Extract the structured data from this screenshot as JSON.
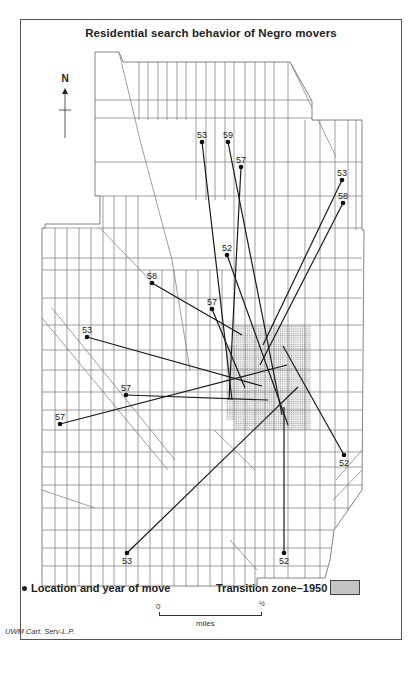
{
  "title": "Residential search behavior of Negro movers",
  "north_arrow": {
    "label": "N",
    "icon": "north-arrow-icon"
  },
  "legend": {
    "move_marker_label": "Location and year of move",
    "transition_zone_label": "Transition  zone–1950",
    "transition_zone_color": "#e6e6e6"
  },
  "scale": {
    "start": "0",
    "end": "½",
    "unit": "miles"
  },
  "credit": "UWM Cart. Serv-L.P.",
  "colors": {
    "street_lines": "#666666",
    "move_lines": "#1a1a1a",
    "frame": "#555555"
  },
  "moves": [
    {
      "year": "53",
      "from": [
        202,
        142
      ],
      "to": [
        232,
        400
      ]
    },
    {
      "year": "59",
      "from": [
        228,
        142
      ],
      "to": [
        282,
        415
      ]
    },
    {
      "year": "57",
      "from": [
        241,
        167
      ],
      "to": [
        229,
        400
      ]
    },
    {
      "year": "53",
      "from": [
        342,
        180
      ],
      "to": [
        263,
        345
      ]
    },
    {
      "year": "58",
      "from": [
        343,
        203
      ],
      "to": [
        260,
        365
      ]
    },
    {
      "year": "52",
      "from": [
        227,
        255
      ],
      "to": [
        288,
        425
      ]
    },
    {
      "year": "58",
      "from": [
        152,
        283
      ],
      "to": [
        242,
        335
      ]
    },
    {
      "year": "57",
      "from": [
        212,
        309
      ],
      "to": [
        245,
        388
      ]
    },
    {
      "year": "53",
      "from": [
        87,
        337
      ],
      "to": [
        262,
        386
      ]
    },
    {
      "year": "57",
      "from": [
        126,
        395
      ],
      "to": [
        268,
        400
      ]
    },
    {
      "year": "57",
      "from": [
        60,
        424
      ],
      "to": [
        287,
        365
      ]
    },
    {
      "year": "52",
      "from": [
        344,
        455
      ],
      "to": [
        283,
        346
      ]
    },
    {
      "year": "53",
      "from": [
        127,
        553
      ],
      "to": [
        298,
        387
      ]
    },
    {
      "year": "52",
      "from": [
        284,
        553
      ],
      "to": [
        284,
        407
      ]
    }
  ]
}
